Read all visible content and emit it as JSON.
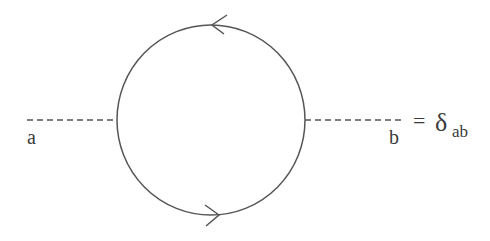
{
  "diagram": {
    "type": "feynman-loop",
    "colors": {
      "stroke": "#555555",
      "text": "#3a3a3a",
      "background": "#ffffff"
    },
    "loop": {
      "cx": 211,
      "cy": 120,
      "rx": 94,
      "ry": 95,
      "orientation": "counterclockwise",
      "arrows": [
        "top-pointing-left",
        "bottom-pointing-right"
      ]
    },
    "external_lines": [
      {
        "id": "left",
        "style": "dashed",
        "label": "a"
      },
      {
        "id": "right",
        "style": "dashed",
        "label": "b"
      }
    ],
    "equation": {
      "equals": "=",
      "symbol": "δ",
      "subscript": "ab"
    }
  }
}
